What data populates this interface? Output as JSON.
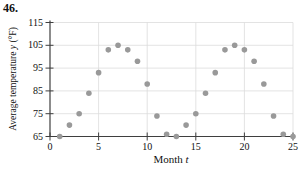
{
  "problem_number": "46.",
  "chart_data": {
    "type": "scatter",
    "xlabel_prefix": "Month ",
    "xlabel_var": "t",
    "ylabel_prefix": "Average temperature ",
    "ylabel_var": "y",
    "ylabel_suffix": " (°F)",
    "x": [
      1,
      2,
      3,
      4,
      5,
      6,
      7,
      8,
      9,
      10,
      11,
      12,
      13,
      14,
      15,
      16,
      17,
      18,
      19,
      20,
      21,
      22,
      23,
      24,
      25
    ],
    "y": [
      65,
      70,
      75,
      84,
      93,
      103,
      105,
      103,
      98,
      88,
      74,
      66,
      65,
      70,
      75,
      84,
      93,
      103,
      105,
      103,
      98,
      88,
      74,
      66,
      65
    ],
    "xticks": [
      0,
      5,
      10,
      15,
      20,
      25
    ],
    "yticks": [
      65,
      75,
      85,
      95,
      105,
      115
    ],
    "xlim": [
      0,
      25
    ],
    "ylim": [
      65,
      115
    ],
    "grid": true,
    "legend": "none",
    "plot_box": {
      "left": 50,
      "right": 293,
      "top": 22.5,
      "bottom": 136.5
    },
    "colors": {
      "dot": "#999999",
      "grid": "#dcdcdc",
      "axis": "#3f3f3f",
      "text": "#111111"
    }
  }
}
